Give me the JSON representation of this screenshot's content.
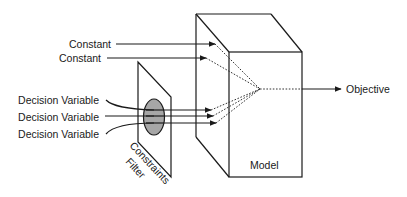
{
  "diagram": {
    "inputs": {
      "constants": [
        {
          "label": "Constant"
        },
        {
          "label": "Constant"
        }
      ],
      "decision_variables": [
        {
          "label": "Decision Variable"
        },
        {
          "label": "Decision Variable"
        },
        {
          "label": "Decision Variable"
        }
      ]
    },
    "filter": {
      "label_line1": "Constraints",
      "label_line2": "Filter",
      "ellipse_color": "#a6a6a6"
    },
    "model": {
      "label": "Model"
    },
    "output": {
      "label": "Objective"
    },
    "colors": {
      "line": "#1a1a1a",
      "background": "#ffffff"
    }
  }
}
